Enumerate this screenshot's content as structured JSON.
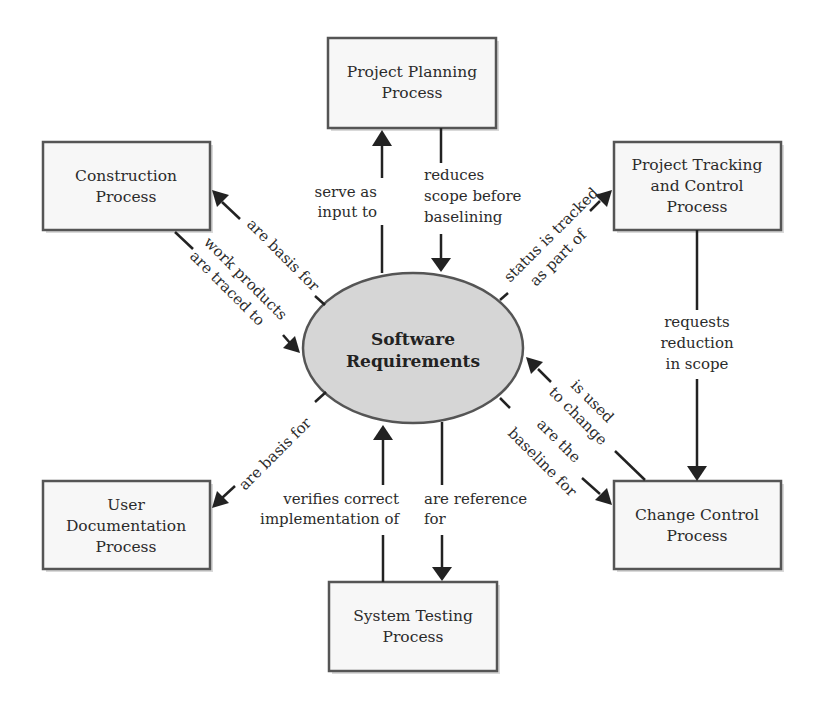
{
  "diagram": {
    "center": {
      "lines": [
        "Software",
        "Requirements"
      ],
      "fill": "#d6d6d6"
    },
    "nodes": {
      "planning": {
        "lines": [
          "Project Planning",
          "Process"
        ]
      },
      "construction": {
        "lines": [
          "Construction",
          "Process"
        ]
      },
      "tracking": {
        "lines": [
          "Project Tracking",
          "and Control",
          "Process"
        ]
      },
      "userdoc": {
        "lines": [
          "User",
          "Documentation",
          "Process"
        ]
      },
      "testing": {
        "lines": [
          "System Testing",
          "Process"
        ]
      },
      "change": {
        "lines": [
          "Change Control",
          "Process"
        ]
      }
    },
    "edges": {
      "req_to_planning": {
        "lines": [
          "serve as",
          "input to"
        ]
      },
      "planning_to_req": {
        "lines": [
          "reduces",
          "scope before",
          "baselining"
        ]
      },
      "req_to_construction": {
        "lines": [
          "are basis for"
        ]
      },
      "construction_to_req": {
        "lines": [
          "work products",
          "are traced to"
        ]
      },
      "req_to_tracking": {
        "lines": [
          "status is tracked",
          "as part of"
        ]
      },
      "tracking_to_change": {
        "lines": [
          "requests",
          "reduction",
          "in scope"
        ]
      },
      "change_to_req": {
        "lines": [
          "is used",
          "to change"
        ]
      },
      "req_to_change": {
        "lines": [
          "are the",
          "baseline for"
        ]
      },
      "req_to_userdoc": {
        "lines": [
          "are basis for"
        ]
      },
      "testing_to_req": {
        "lines": [
          "verifies correct",
          "implementation of"
        ]
      },
      "req_to_testing": {
        "lines": [
          "are reference",
          "for"
        ]
      }
    }
  }
}
